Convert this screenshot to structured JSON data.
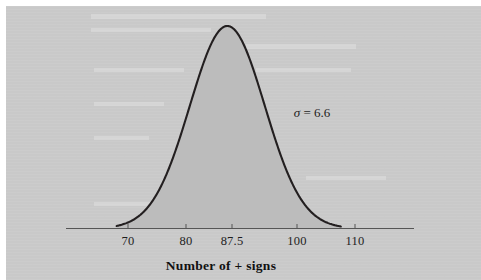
{
  "figure": {
    "background_color": "#c9c9c9",
    "page_margin_color": "#ffffff",
    "curve_color": "#231f20",
    "fill_color": "#bcbcbc",
    "axis_color": "#4a4a4a"
  },
  "annotation": {
    "sigma_symbol": "σ",
    "sigma_equals": " = ",
    "sigma_value": "6.6",
    "sigma_full": "σ = 6.6"
  },
  "axis": {
    "title": "Number of + signs",
    "tick_labels": [
      "70",
      "80",
      "87.5",
      "100",
      "110"
    ],
    "tick_values": [
      70,
      80,
      87.5,
      100,
      110
    ],
    "tick_pixel_x": [
      128,
      186,
      232,
      297,
      355
    ]
  },
  "chart_data": {
    "type": "line",
    "title": "",
    "subtitle": "",
    "xlabel": "Number of + signs",
    "ylabel": "",
    "distribution": "normal",
    "mean": 87.5,
    "sigma": 6.6,
    "annotations": [
      {
        "text": "σ = 6.6",
        "x": 101,
        "y_fraction": 0.52
      }
    ],
    "xticks": [
      70,
      80,
      87.5,
      100,
      110
    ],
    "xticklabels": [
      "70",
      "80",
      "87.5",
      "100",
      "110"
    ],
    "xlim": [
      77.6,
      126.0
    ],
    "ylim": [
      0,
      1
    ],
    "grid": false,
    "legend": null,
    "shaded": true,
    "shaded_region": "entire curve",
    "x": [
      68.0,
      70.0,
      72.0,
      74.0,
      76.0,
      78.0,
      80.0,
      82.0,
      84.0,
      86.0,
      87.5,
      89.0,
      91.0,
      93.0,
      95.0,
      97.0,
      99.0,
      101.0,
      103.0,
      105.0,
      107.0
    ],
    "values": [
      0.0107,
      0.0241,
      0.0501,
      0.0963,
      0.1709,
      0.2801,
      0.4243,
      0.5942,
      0.7686,
      0.9175,
      1.0,
      0.9662,
      0.8267,
      0.6529,
      0.4759,
      0.3201,
      0.1988,
      0.114,
      0.0603,
      0.0294,
      0.0133
    ],
    "y_formula": "exp(-((x-87.5)^2)/(2*6.6^2))"
  }
}
